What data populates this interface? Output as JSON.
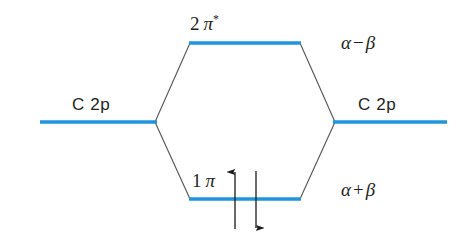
{
  "figure": {
    "type": "molecular-orbital-energy-diagram",
    "background_color": "#ffffff",
    "level_color": "#1f95dd",
    "correlation_line_color": "#58595b",
    "text_color": "#231f20"
  },
  "levels": {
    "antibonding": {
      "orbital_number": "2",
      "orbital_symbol": "π",
      "orbital_superscript": "*",
      "energy_label_left": "α",
      "energy_label_operator": "−",
      "energy_label_right": "β",
      "x_start": 190,
      "x_end": 300,
      "y": 43
    },
    "bonding": {
      "orbital_number": "1",
      "orbital_symbol": "π",
      "orbital_superscript": "",
      "energy_label_left": "α",
      "energy_label_operator": "+",
      "energy_label_right": "β",
      "x_start": 190,
      "x_end": 300,
      "y": 199
    },
    "atomic_left": {
      "label": "C 2p",
      "x_start": 40,
      "x_end": 155,
      "y": 122
    },
    "atomic_right": {
      "label": "C 2p",
      "x_start": 335,
      "x_end": 447,
      "y": 122
    }
  },
  "electrons": [
    {
      "name": "spin-up-electron",
      "spin": "up",
      "x": 235,
      "y_top": 171,
      "y_bottom": 229
    },
    {
      "name": "spin-down-electron",
      "spin": "down",
      "x": 256,
      "y_top": 171,
      "y_bottom": 229
    }
  ]
}
